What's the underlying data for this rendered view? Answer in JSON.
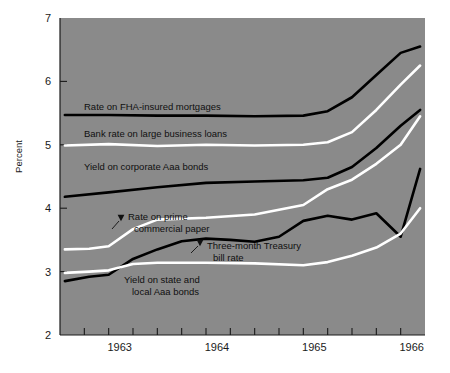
{
  "chart_data": {
    "type": "line",
    "title": "",
    "subtitle": "",
    "xlabel": "",
    "ylabel": "Percent",
    "ylim": [
      2,
      7
    ],
    "xlim": [
      1962.5,
      1966.25
    ],
    "grid": false,
    "legend_position": "inline-annotations",
    "background_color": "#8a8a8a",
    "plot_area_px": {
      "left": 60,
      "top": 18,
      "right": 425,
      "bottom": 335
    },
    "y_ticks": [
      2,
      3,
      4,
      5,
      6,
      7
    ],
    "y_tick_labels": [
      "2",
      "3",
      "4",
      "5",
      "6",
      "7"
    ],
    "x_tick_labels": [
      "1963",
      "1964",
      "1965",
      "1966"
    ],
    "x_tick_label_values": [
      1963,
      1964,
      1965,
      1966
    ],
    "x_minor_ticks_per_year": 4,
    "x_minor_tick_values": [
      1962.75,
      1963.0,
      1963.25,
      1963.5,
      1963.75,
      1964.0,
      1964.25,
      1964.5,
      1964.75,
      1965.0,
      1965.25,
      1965.5,
      1965.75,
      1966.0
    ],
    "series": [
      {
        "name": "Rate on FHA-insured mortgages",
        "color": "#000000",
        "label_text": "Rate on FHA-insured mortgages",
        "label_px": {
          "x": 84,
          "y": 110
        },
        "label_anchor": "start",
        "annotation_style": "direct",
        "x": [
          1962.55,
          1963.0,
          1963.5,
          1964.0,
          1964.5,
          1965.0,
          1965.25,
          1965.5,
          1965.75,
          1966.0,
          1966.2
        ],
        "values": [
          5.47,
          5.47,
          5.46,
          5.46,
          5.45,
          5.46,
          5.53,
          5.75,
          6.1,
          6.45,
          6.55
        ]
      },
      {
        "name": "Bank rate on large business loans",
        "color": "#ffffff",
        "label_text": "Bank rate on large business loans",
        "label_px": {
          "x": 84,
          "y": 137
        },
        "label_anchor": "start",
        "annotation_style": "direct",
        "x": [
          1962.55,
          1963.0,
          1963.5,
          1964.0,
          1964.5,
          1965.0,
          1965.25,
          1965.5,
          1965.75,
          1966.0,
          1966.2
        ],
        "values": [
          4.99,
          5.01,
          4.98,
          5.0,
          4.99,
          5.0,
          5.04,
          5.2,
          5.55,
          5.95,
          6.25
        ]
      },
      {
        "name": "Yield on corporate Aaa bonds",
        "color": "#000000",
        "label_text": "Yield on corporate Aaa bonds",
        "label_px": {
          "x": 84,
          "y": 170
        },
        "label_anchor": "start",
        "annotation_style": "direct",
        "x": [
          1962.55,
          1963.0,
          1963.5,
          1964.0,
          1964.5,
          1965.0,
          1965.25,
          1965.5,
          1965.75,
          1966.0,
          1966.2
        ],
        "values": [
          4.18,
          4.25,
          4.33,
          4.4,
          4.42,
          4.44,
          4.48,
          4.65,
          4.95,
          5.3,
          5.55
        ]
      },
      {
        "name": "Rate on prime commercial paper",
        "color": "#ffffff",
        "label_text": "Rate on prime\ncommercial paper",
        "label_lines": [
          "Rate on prime",
          "commercial paper"
        ],
        "label_px": {
          "x": 128,
          "y": 220
        },
        "label_anchor": "start",
        "annotation_style": "arrow",
        "arrow_px": {
          "x": 121,
          "y": 218
        },
        "leader_px": {
          "x1": 119,
          "y1": 221,
          "x2": 112,
          "y2": 229
        },
        "x": [
          1962.55,
          1962.8,
          1963.0,
          1963.25,
          1963.5,
          1964.0,
          1964.5,
          1965.0,
          1965.25,
          1965.5,
          1965.75,
          1966.0,
          1966.2
        ],
        "values": [
          3.35,
          3.36,
          3.4,
          3.67,
          3.82,
          3.85,
          3.9,
          4.05,
          4.3,
          4.45,
          4.7,
          5.0,
          5.45
        ]
      },
      {
        "name": "Three-month Treasury bill rate",
        "color": "#000000",
        "label_text": "Three-month Treasury\nbill rate",
        "label_lines": [
          "Three-month Treasury",
          "bill rate"
        ],
        "label_px": {
          "x": 207,
          "y": 249
        },
        "label_anchor": "start",
        "annotation_style": "arrow",
        "arrow_px": {
          "x": 200,
          "y": 243
        },
        "leader_px": {
          "x1": 198,
          "y1": 246,
          "x2": 191,
          "y2": 253
        },
        "x": [
          1962.55,
          1962.8,
          1963.0,
          1963.25,
          1963.5,
          1963.75,
          1964.0,
          1964.25,
          1964.5,
          1964.75,
          1965.0,
          1965.25,
          1965.5,
          1965.75,
          1966.0,
          1966.2
        ],
        "values": [
          2.85,
          2.92,
          2.95,
          3.2,
          3.35,
          3.48,
          3.52,
          3.5,
          3.47,
          3.55,
          3.8,
          3.88,
          3.82,
          3.92,
          3.55,
          4.62
        ]
      },
      {
        "name": "Yield on state and local Aaa bonds",
        "color": "#ffffff",
        "label_text": "Yield on state and\nlocal Aaa bonds",
        "label_lines": [
          "Yield on state and",
          "local Aaa bonds"
        ],
        "label_px": {
          "x": 124,
          "y": 283
        },
        "label_anchor": "start",
        "annotation_style": "direct",
        "x": [
          1962.55,
          1962.8,
          1963.0,
          1963.25,
          1963.5,
          1964.0,
          1964.5,
          1965.0,
          1965.25,
          1965.5,
          1965.75,
          1966.0,
          1966.2
        ],
        "values": [
          2.98,
          3.0,
          3.02,
          3.12,
          3.14,
          3.14,
          3.13,
          3.1,
          3.15,
          3.25,
          3.38,
          3.6,
          4.0
        ]
      }
    ]
  }
}
